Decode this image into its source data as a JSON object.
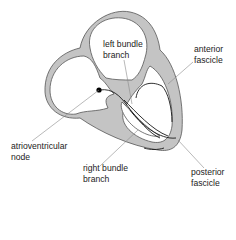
{
  "diagram": {
    "colors": {
      "wall_fill": "#c4c4c4",
      "wall_stroke": "#555555",
      "conduction_line": "#1a1a1a",
      "leader_line": "#8a8a8a",
      "node_dot": "#000000"
    },
    "labels": {
      "left_bundle_branch": [
        "left bundle",
        "branch"
      ],
      "anterior_fascicle": [
        "anterior",
        "fascicle"
      ],
      "atrioventricular_node": [
        "atrioventricular",
        "node"
      ],
      "right_bundle_branch": [
        "right bundle",
        "branch"
      ],
      "posterior_fascicle": [
        "posterior",
        "fascicle"
      ]
    }
  }
}
